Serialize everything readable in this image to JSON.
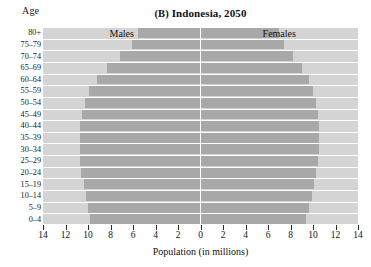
{
  "chart_data": {
    "type": "bar",
    "subtype": "population-pyramid",
    "title": "(B) Indonesia, 2050",
    "panel_letter": "(B)",
    "title_text": "Indonesia, 2050",
    "xlabel": "Population (in millions)",
    "ylabel": "Age",
    "xlim": [
      -14,
      14
    ],
    "xticks": [
      14,
      12,
      10,
      8,
      6,
      4,
      2,
      0,
      2,
      4,
      6,
      8,
      10,
      12,
      14
    ],
    "grid": false,
    "legend_position": "inside-top",
    "categories": [
      "80+",
      "75–79",
      "70–74",
      "65–69",
      "60–64",
      "55–59",
      "50–54",
      "45–49",
      "40–44",
      "35–39",
      "30–34",
      "25–29",
      "20–24",
      "15–19",
      "10–14",
      "5–9",
      "0–4"
    ],
    "series": [
      {
        "name": "Males",
        "side": "left",
        "values": [
          5.6,
          6.1,
          7.2,
          8.3,
          9.2,
          9.9,
          10.3,
          10.5,
          10.7,
          10.7,
          10.7,
          10.7,
          10.6,
          10.4,
          10.2,
          10.0,
          9.8
        ]
      },
      {
        "name": "Females",
        "side": "right",
        "values": [
          7.0,
          7.4,
          8.2,
          9.0,
          9.6,
          10.0,
          10.3,
          10.4,
          10.5,
          10.5,
          10.5,
          10.4,
          10.3,
          10.1,
          9.9,
          9.6,
          9.4
        ]
      }
    ],
    "colors": {
      "bar": "#a8a8a8",
      "background": "#d4d4d4",
      "axis_line": "#ffffff",
      "text": "#111111"
    }
  },
  "labels": {
    "age_axis": "Age",
    "males": "Males",
    "females": "Females",
    "population_axis": "Population (in millions)"
  }
}
